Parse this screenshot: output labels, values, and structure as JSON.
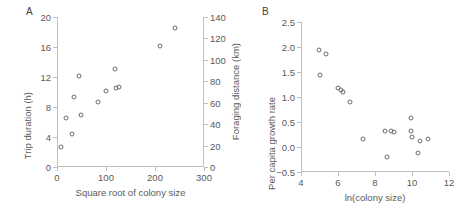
{
  "figure": {
    "panels": [
      {
        "label": "A",
        "chart_data": {
          "type": "scatter",
          "title": "",
          "xlabel": "Square root of colony size",
          "ylabel": "Trip duration (h)",
          "y2label": "Foraging distance (km)",
          "xlim": [
            0,
            300
          ],
          "ylim": [
            0,
            20
          ],
          "y2lim": [
            0,
            140
          ],
          "xticks": [
            0,
            100,
            200,
            300
          ],
          "yticks": [
            0,
            4,
            8,
            12,
            16,
            20
          ],
          "y2ticks": [
            0,
            20,
            40,
            60,
            80,
            100,
            120,
            140
          ],
          "grid": false,
          "legend": "none",
          "points": [
            {
              "x": 8,
              "y": 2.7
            },
            {
              "x": 18,
              "y": 6.5
            },
            {
              "x": 31,
              "y": 4.4
            },
            {
              "x": 34,
              "y": 9.3
            },
            {
              "x": 45,
              "y": 12.1
            },
            {
              "x": 49,
              "y": 6.9
            },
            {
              "x": 84,
              "y": 8.7
            },
            {
              "x": 99,
              "y": 10.2
            },
            {
              "x": 119,
              "y": 13.1
            },
            {
              "x": 120,
              "y": 10.5
            },
            {
              "x": 127,
              "y": 10.7
            },
            {
              "x": 211,
              "y": 16.1
            },
            {
              "x": 241,
              "y": 18.5
            }
          ]
        }
      },
      {
        "label": "B",
        "chart_data": {
          "type": "scatter",
          "title": "",
          "xlabel": "ln(colony size)",
          "ylabel": "Per capita growth rate",
          "xlim": [
            4,
            12
          ],
          "ylim": [
            -0.5,
            2.5
          ],
          "xticks": [
            4,
            6,
            8,
            10,
            12
          ],
          "yticks": [
            -0.5,
            0.0,
            0.5,
            1.0,
            1.5,
            2.0,
            2.5
          ],
          "ytick_labels": [
            "−0.5",
            "0.0",
            "0.5",
            "1.0",
            "1.5",
            "2.0",
            "2.5"
          ],
          "grid": false,
          "legend": "none",
          "points": [
            {
              "x": 4.95,
              "y": 1.95
            },
            {
              "x": 5.0,
              "y": 1.45
            },
            {
              "x": 5.35,
              "y": 1.86
            },
            {
              "x": 6.0,
              "y": 1.18
            },
            {
              "x": 6.15,
              "y": 1.14
            },
            {
              "x": 6.25,
              "y": 1.1
            },
            {
              "x": 6.65,
              "y": 0.91
            },
            {
              "x": 7.35,
              "y": 0.16
            },
            {
              "x": 8.55,
              "y": 0.32
            },
            {
              "x": 8.65,
              "y": -0.19
            },
            {
              "x": 8.85,
              "y": 0.33
            },
            {
              "x": 9.0,
              "y": 0.31
            },
            {
              "x": 9.95,
              "y": 0.58
            },
            {
              "x": 9.95,
              "y": 0.32
            },
            {
              "x": 10.0,
              "y": 0.21
            },
            {
              "x": 10.3,
              "y": -0.11
            },
            {
              "x": 10.45,
              "y": 0.13
            },
            {
              "x": 10.85,
              "y": 0.16
            }
          ]
        }
      }
    ]
  }
}
